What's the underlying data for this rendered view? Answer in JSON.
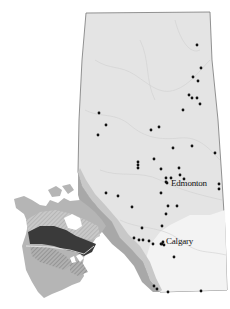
{
  "map": {
    "region": "Alberta",
    "cities": [
      {
        "name": "Edmonton",
        "x": 170,
        "y": 180
      },
      {
        "name": "Calgary",
        "x": 166,
        "y": 238
      }
    ],
    "colors": {
      "land": "#e4e4e4",
      "mountains": "#a8a8a8",
      "foothills": "#c8c8c8",
      "prairie": "#f3f3f3",
      "border": "#777777",
      "dot": "#111111",
      "inset_dark": "#3a3a3a",
      "inset_mid": "#8a8a8a",
      "inset_light": "#b5b5b5"
    },
    "sites": [
      [
        197,
        45
      ],
      [
        201,
        68
      ],
      [
        193,
        77
      ],
      [
        198,
        81
      ],
      [
        189,
        95
      ],
      [
        192,
        98
      ],
      [
        197,
        98
      ],
      [
        200,
        104
      ],
      [
        183,
        110
      ],
      [
        99,
        113
      ],
      [
        106,
        125
      ],
      [
        98,
        135
      ],
      [
        151,
        130
      ],
      [
        159,
        127
      ],
      [
        173,
        148
      ],
      [
        192,
        146
      ],
      [
        215,
        153
      ],
      [
        154,
        159
      ],
      [
        138,
        162
      ],
      [
        138,
        165
      ],
      [
        138,
        168
      ],
      [
        161,
        169
      ],
      [
        179,
        168
      ],
      [
        180,
        175
      ],
      [
        184,
        179
      ],
      [
        166,
        178
      ],
      [
        166,
        182
      ],
      [
        167,
        183
      ],
      [
        171,
        178
      ],
      [
        219,
        184
      ],
      [
        219,
        189
      ],
      [
        106,
        193
      ],
      [
        118,
        196
      ],
      [
        161,
        193
      ],
      [
        132,
        207
      ],
      [
        168,
        206
      ],
      [
        177,
        206
      ],
      [
        166,
        214
      ],
      [
        162,
        226
      ],
      [
        142,
        228
      ],
      [
        134,
        238
      ],
      [
        139,
        240
      ],
      [
        143,
        240
      ],
      [
        149,
        241
      ],
      [
        153,
        244
      ],
      [
        161,
        244
      ],
      [
        162,
        244
      ],
      [
        163,
        242
      ],
      [
        164,
        245
      ],
      [
        174,
        257
      ],
      [
        154,
        286
      ],
      [
        157,
        289
      ],
      [
        168,
        292
      ],
      [
        201,
        291
      ]
    ]
  }
}
